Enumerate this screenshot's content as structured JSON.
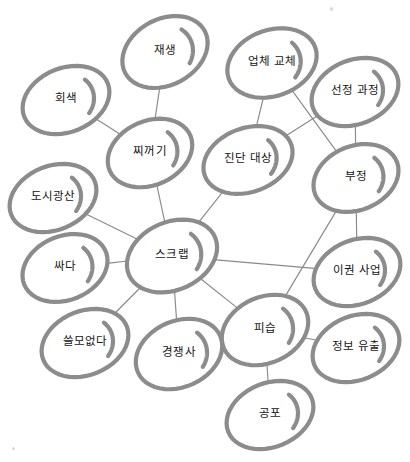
{
  "diagram": {
    "type": "concept-network-graph",
    "title": "",
    "background_color": "#ffffff",
    "node_stroke_color": "#8c8c8c",
    "edge_stroke_color": "#8a8a8a",
    "label_color": "#141414",
    "nodes": [
      {
        "id": "jaesaeng",
        "label": "재생",
        "cx": 165,
        "cy": 52,
        "rx": 45,
        "ry": 33,
        "rot": -28
      },
      {
        "id": "upche-gyoche",
        "label": "업체 교체",
        "cx": 272,
        "cy": 63,
        "rx": 46,
        "ry": 33,
        "rot": -20
      },
      {
        "id": "seonjeong",
        "label": "선정 과정",
        "cx": 355,
        "cy": 92,
        "rx": 45,
        "ry": 32,
        "rot": -22
      },
      {
        "id": "hoesaek",
        "label": "회색",
        "cx": 66,
        "cy": 100,
        "rx": 45,
        "ry": 32,
        "rot": -22
      },
      {
        "id": "jjikkeogi",
        "label": "찌꺼기",
        "cx": 150,
        "cy": 153,
        "rx": 44,
        "ry": 32,
        "rot": -24
      },
      {
        "id": "jindan",
        "label": "진단 대상",
        "cx": 248,
        "cy": 160,
        "rx": 46,
        "ry": 32,
        "rot": -20
      },
      {
        "id": "bujeong",
        "label": "부정",
        "cx": 356,
        "cy": 178,
        "rx": 44,
        "ry": 32,
        "rot": -22
      },
      {
        "id": "dosi",
        "label": "도시광산",
        "cx": 53,
        "cy": 198,
        "rx": 45,
        "ry": 32,
        "rot": -22
      },
      {
        "id": "seukeurap",
        "label": "스크랩",
        "cx": 172,
        "cy": 256,
        "rx": 47,
        "ry": 34,
        "rot": -24
      },
      {
        "id": "ssada",
        "label": "싸다",
        "cx": 65,
        "cy": 268,
        "rx": 44,
        "ry": 32,
        "rot": -22
      },
      {
        "id": "igwon",
        "label": "이권 사업",
        "cx": 357,
        "cy": 272,
        "rx": 45,
        "ry": 32,
        "rot": -22
      },
      {
        "id": "sseulmo",
        "label": "쓸모없다",
        "cx": 85,
        "cy": 343,
        "rx": 45,
        "ry": 32,
        "rot": -22
      },
      {
        "id": "gyeongjaengsa",
        "label": "경쟁사",
        "cx": 179,
        "cy": 354,
        "rx": 45,
        "ry": 33,
        "rot": -24
      },
      {
        "id": "piseup",
        "label": "피습",
        "cx": 265,
        "cy": 330,
        "rx": 45,
        "ry": 33,
        "rot": -24
      },
      {
        "id": "jeongbo",
        "label": "정보 유출",
        "cx": 356,
        "cy": 348,
        "rx": 45,
        "ry": 32,
        "rot": -22
      },
      {
        "id": "gongpo",
        "label": "공포",
        "cx": 270,
        "cy": 415,
        "rx": 45,
        "ry": 32,
        "rot": -22
      }
    ],
    "edges": [
      {
        "from": "jaesaeng",
        "to": "jjikkeogi"
      },
      {
        "from": "hoesaek",
        "to": "jjikkeogi"
      },
      {
        "from": "jjikkeogi",
        "to": "seukeurap"
      },
      {
        "from": "upche-gyoche",
        "to": "jindan"
      },
      {
        "from": "upche-gyoche",
        "to": "bujeong"
      },
      {
        "from": "seonjeong",
        "to": "jindan"
      },
      {
        "from": "seonjeong",
        "to": "bujeong"
      },
      {
        "from": "jindan",
        "to": "seukeurap"
      },
      {
        "from": "bujeong",
        "to": "igwon"
      },
      {
        "from": "bujeong",
        "to": "piseup"
      },
      {
        "from": "dosi",
        "to": "seukeurap"
      },
      {
        "from": "ssada",
        "to": "seukeurap"
      },
      {
        "from": "sseulmo",
        "to": "seukeurap"
      },
      {
        "from": "gyeongjaengsa",
        "to": "seukeurap"
      },
      {
        "from": "seukeurap",
        "to": "piseup"
      },
      {
        "from": "seukeurap",
        "to": "igwon"
      },
      {
        "from": "piseup",
        "to": "jeongbo"
      },
      {
        "from": "piseup",
        "to": "gongpo"
      }
    ]
  }
}
